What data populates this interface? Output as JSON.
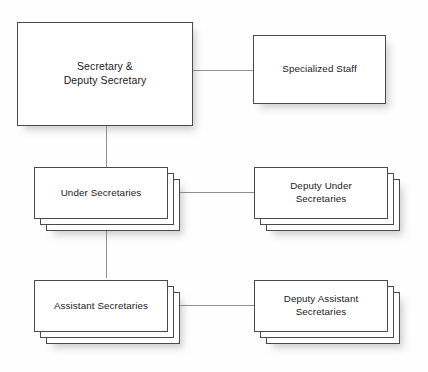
{
  "diagram": {
    "background_color": "#fefefe",
    "border_color": "#4a4a4a",
    "connector_color": "#8e9094",
    "text_color": "#1b1b1b"
  },
  "nodes": {
    "secretary": {
      "label": "Secretary &\nDeputy Secretary",
      "stacked": false,
      "stack_count": 1
    },
    "specialized_staff": {
      "label": "Specialized Staff",
      "stacked": false,
      "stack_count": 1
    },
    "under_secretaries": {
      "label": "Under Secretaries",
      "stacked": true,
      "stack_count": 3
    },
    "deputy_under_secretaries": {
      "label": "Deputy Under\nSecretaries",
      "stacked": true,
      "stack_count": 3
    },
    "assistant_secretaries": {
      "label": "Assistant Secretaries",
      "stacked": true,
      "stack_count": 3
    },
    "deputy_assistant_secretaries": {
      "label": "Deputy Assistant\nSecretaries",
      "stacked": true,
      "stack_count": 3
    }
  },
  "connections": [
    {
      "from": "secretary",
      "to": "specialized_staff",
      "orientation": "horizontal"
    },
    {
      "from": "secretary",
      "to": "under_secretaries",
      "orientation": "vertical"
    },
    {
      "from": "under_secretaries",
      "to": "deputy_under_secretaries",
      "orientation": "horizontal"
    },
    {
      "from": "under_secretaries",
      "to": "assistant_secretaries",
      "orientation": "vertical"
    },
    {
      "from": "assistant_secretaries",
      "to": "deputy_assistant_secretaries",
      "orientation": "horizontal"
    }
  ]
}
